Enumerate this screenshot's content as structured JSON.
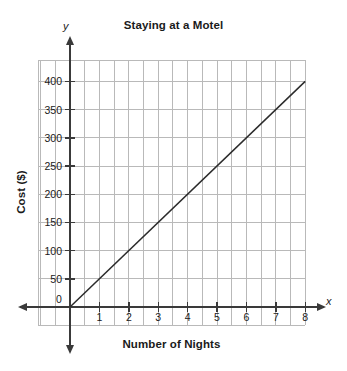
{
  "chart_data": {
    "type": "line",
    "title": "Staying at a Motel",
    "xlabel": "Number of Nights",
    "ylabel": "Cost ($)",
    "x_axis_letter": "x",
    "y_axis_letter": "y",
    "x": [
      0,
      1,
      2,
      3,
      4,
      5,
      6,
      7,
      8
    ],
    "values": [
      0,
      50,
      100,
      150,
      200,
      250,
      300,
      350,
      400
    ],
    "series": [
      {
        "name": "Cost",
        "x": [
          0,
          8
        ],
        "values": [
          0,
          400
        ],
        "color": "#2b2b2b"
      }
    ],
    "xlim": [
      -0.5,
      9.2
    ],
    "ylim": [
      -50,
      425
    ],
    "xticks": [
      0,
      1,
      2,
      3,
      4,
      5,
      6,
      7,
      8
    ],
    "xtick_labels": [
      "0",
      "1",
      "2",
      "3",
      "4",
      "5",
      "6",
      "7",
      "8"
    ],
    "yticks": [
      50,
      100,
      150,
      200,
      250,
      300,
      350,
      400
    ],
    "ytick_labels": [
      "50",
      "100",
      "150",
      "200",
      "250",
      "300",
      "350",
      "400"
    ],
    "origin_label": "0",
    "grid": true,
    "grid_color": "#b9b9b9",
    "grid_x_step": 0.5,
    "grid_y_step": 50,
    "axis_color": "#3a3a3a",
    "legend": null,
    "slope_per_night": 50,
    "intercept": 0,
    "annotations": []
  }
}
